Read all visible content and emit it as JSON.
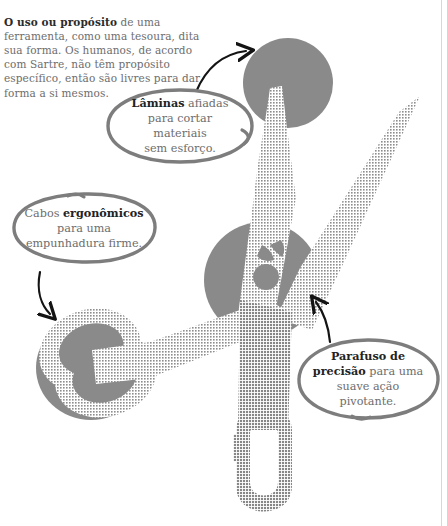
{
  "page": {
    "title": "O uso ou propósito de uma ferramenta",
    "language": "pt-BR",
    "background_color": "#ffffff",
    "width": 447,
    "height": 526
  },
  "intro": {
    "lead": "O uso ou propósito",
    "body": " de uma ferramenta, como uma tesoura, dita sua forma. Os humanos, de acordo com Sartre, não têm propósito específico, então são livres para dar forma a si mesmos."
  },
  "illustration": {
    "subject": "scissors-illustration",
    "colors": {
      "accent_gray": "#8a8a8a",
      "blade_hatch": "#9a9a9a",
      "bubble_stroke": "#7d7d7d",
      "arrow_stroke": "#1a1a1a",
      "text_muted": "#6d6d6d",
      "text_strong": "#232323"
    },
    "parts": [
      {
        "name": "upper-blade-left",
        "label": "blade"
      },
      {
        "name": "upper-blade-right",
        "label": "blade"
      },
      {
        "name": "pivot-screw",
        "label": "screw"
      },
      {
        "name": "handle-left-ring",
        "label": "handle"
      },
      {
        "name": "handle-bottom-ring",
        "label": "handle"
      }
    ]
  },
  "callouts": [
    {
      "id": "blades",
      "lead": "Lâminas",
      "rest": " afiadas",
      "line2": "para cortar materiais",
      "line3": "sem esforço.",
      "arrow": "curved-arrow-up-right",
      "points_to": "upper-blade-left"
    },
    {
      "id": "handles",
      "pre": "Cabos ",
      "lead": "ergonômicos",
      "line2": "para uma",
      "line3": "empunhadura firme.",
      "arrow": "curved-arrow-down",
      "points_to": "handle-left-ring"
    },
    {
      "id": "screw",
      "lead": "Parafuso de",
      "lead2": "precisão",
      "rest": " para uma",
      "line3": "suave ação",
      "line4": "pivotante.",
      "arrow": "curved-arrow-up-left",
      "points_to": "pivot-screw"
    }
  ]
}
